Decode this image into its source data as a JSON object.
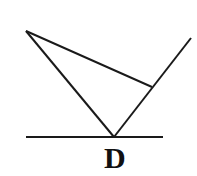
{
  "figure": {
    "background_color": "#ffffff",
    "stroke_color": "#1a1a1a",
    "canvas": {
      "width": 197,
      "height": 176
    }
  },
  "labels": [
    {
      "id": "D",
      "text": "D",
      "x": 115,
      "y": 158,
      "font_size": 30,
      "bold": true,
      "color": "#111111"
    }
  ],
  "points": {
    "A": {
      "name": "top-left-apex",
      "x": 26,
      "y": 31
    },
    "D": {
      "name": "base-vertex-D",
      "x": 114,
      "y": 137
    },
    "C": {
      "name": "right-intersection",
      "x": 152,
      "y": 87
    },
    "E": {
      "name": "ray-upper-right-end",
      "x": 191,
      "y": 38
    },
    "L": {
      "name": "baseline-left-end",
      "x": 26,
      "y": 137
    },
    "R": {
      "name": "baseline-right-end",
      "x": 163,
      "y": 137
    }
  },
  "segments": [
    {
      "id": "seg-baseline",
      "name": "horizontal-baseline",
      "from": "L",
      "to": "R",
      "x1": 26,
      "y1": 137,
      "x2": 163,
      "y2": 137,
      "width": 2.2
    },
    {
      "id": "seg-apex-to-D",
      "name": "left-side-apex-to-D",
      "from": "A",
      "to": "D",
      "x1": 26,
      "y1": 31,
      "x2": 114,
      "y2": 137,
      "width": 2.0
    },
    {
      "id": "seg-apex-to-C",
      "name": "upper-side-apex-to-intersection",
      "from": "A",
      "to": "C",
      "x1": 26,
      "y1": 31,
      "x2": 152,
      "y2": 87,
      "width": 2.0
    },
    {
      "id": "seg-D-to-E",
      "name": "ray-D-through-intersection-to-upper-right",
      "from": "D",
      "to": "E",
      "x1": 114,
      "y1": 137,
      "x2": 191,
      "y2": 38,
      "width": 2.0
    }
  ]
}
